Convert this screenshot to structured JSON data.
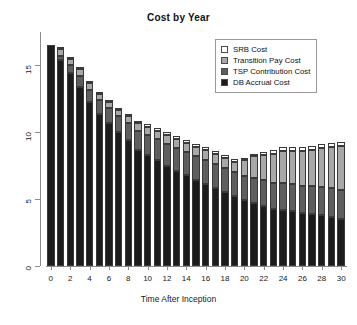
{
  "chart_data": {
    "type": "bar",
    "subtype": "stacked",
    "title": "Cost by Year",
    "xlabel": "Time After Inception",
    "ylabel": "",
    "grid": false,
    "legend_position": "top-right",
    "ylim": [
      0,
      17.5
    ],
    "xlim": [
      -0.5,
      30.5
    ],
    "ytick_labels": [
      "0",
      "5",
      "10",
      "15"
    ],
    "ytick_values": [
      0,
      5,
      10,
      15
    ],
    "xtick_labels": [
      "0",
      "2",
      "4",
      "6",
      "8",
      "10",
      "12",
      "14",
      "16",
      "18",
      "20",
      "22",
      "24",
      "26",
      "28",
      "30"
    ],
    "xtick_values": [
      0,
      2,
      4,
      6,
      8,
      10,
      12,
      14,
      16,
      18,
      20,
      22,
      24,
      26,
      28,
      30
    ],
    "categories": [
      0,
      1,
      2,
      3,
      4,
      5,
      6,
      7,
      8,
      9,
      10,
      11,
      12,
      13,
      14,
      15,
      16,
      17,
      18,
      19,
      20,
      21,
      22,
      23,
      24,
      25,
      26,
      27,
      28,
      29,
      30
    ],
    "series": [
      {
        "name": "DB Accrual Cost",
        "color": "#1c1c1c",
        "values": [
          16.5,
          15.4,
          14.4,
          13.4,
          12.3,
          11.4,
          10.7,
          10.0,
          9.4,
          8.7,
          8.3,
          7.9,
          7.5,
          7.1,
          6.8,
          6.4,
          6.1,
          5.8,
          5.5,
          5.2,
          4.9,
          4.7,
          4.5,
          4.3,
          4.2,
          4.1,
          4.0,
          3.9,
          3.8,
          3.7,
          3.5
        ]
      },
      {
        "name": "TSP Contribution Cost",
        "color": "#5e5e5e",
        "values": [
          0.0,
          0.3,
          0.6,
          0.8,
          0.9,
          1.0,
          1.1,
          1.2,
          1.3,
          1.4,
          1.5,
          1.6,
          1.6,
          1.7,
          1.7,
          1.8,
          1.8,
          1.8,
          1.8,
          1.8,
          1.8,
          1.9,
          1.9,
          1.9,
          2.0,
          2.0,
          2.0,
          2.1,
          2.1,
          2.1,
          2.2
        ]
      },
      {
        "name": "Transition Pay Cost",
        "color": "#a8a8a8",
        "values": [
          0.0,
          0.5,
          0.5,
          0.5,
          0.5,
          0.5,
          0.5,
          0.5,
          0.5,
          0.6,
          0.6,
          0.6,
          0.7,
          0.7,
          0.7,
          0.7,
          0.8,
          0.8,
          0.8,
          0.8,
          1.2,
          1.6,
          1.9,
          2.2,
          2.4,
          2.5,
          2.6,
          2.7,
          2.9,
          3.1,
          3.3
        ]
      },
      {
        "name": "SRB Cost",
        "color": "#ffffff",
        "values": [
          0.0,
          0.1,
          0.1,
          0.1,
          0.1,
          0.1,
          0.1,
          0.1,
          0.1,
          0.1,
          0.2,
          0.2,
          0.2,
          0.2,
          0.2,
          0.2,
          0.2,
          0.2,
          0.2,
          0.2,
          0.2,
          0.2,
          0.2,
          0.3,
          0.3,
          0.3,
          0.3,
          0.3,
          0.3,
          0.3,
          0.3
        ]
      }
    ],
    "totals": [
      16.5,
      16.3,
      15.6,
      14.8,
      13.8,
      13.0,
      12.4,
      11.8,
      11.3,
      10.8,
      10.6,
      10.3,
      10.0,
      9.7,
      9.4,
      9.1,
      8.9,
      8.6,
      8.3,
      8.0,
      8.1,
      8.4,
      8.5,
      8.7,
      8.9,
      8.9,
      8.9,
      9.0,
      9.1,
      9.2,
      9.3
    ]
  },
  "legend": {
    "items": [
      {
        "label": "SRB Cost",
        "color": "#ffffff"
      },
      {
        "label": "Transition Pay Cost",
        "color": "#a8a8a8"
      },
      {
        "label": "TSP Contribution Cost",
        "color": "#5e5e5e"
      },
      {
        "label": "DB Accrual Cost",
        "color": "#1c1c1c"
      }
    ]
  }
}
